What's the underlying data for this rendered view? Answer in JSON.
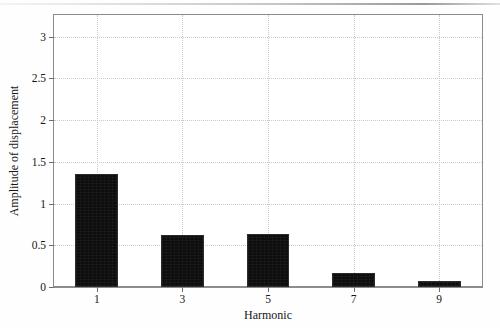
{
  "chart_data": {
    "type": "bar",
    "title": "",
    "subtitle": "",
    "xlabel": "Harmonic",
    "ylabel": "Amplitude of displacement",
    "categories": [
      "1",
      "3",
      "5",
      "7",
      "9"
    ],
    "values": [
      1.36,
      0.62,
      0.64,
      0.17,
      0.07
    ],
    "series": [
      {
        "name": "Amplitude of displacement",
        "values": [
          1.36,
          0.62,
          0.64,
          0.17,
          0.07
        ]
      }
    ],
    "ylim": [
      0,
      3.26
    ],
    "xlim": [
      0,
      10
    ],
    "yticks": [
      0,
      0.5,
      1,
      1.5,
      2,
      2.5,
      3
    ],
    "ytick_labels": [
      "0",
      "0.5",
      "1",
      "1.5",
      "2",
      "2.5",
      "3"
    ],
    "xticks": [
      1,
      3,
      5,
      7,
      9
    ],
    "xtick_labels": [
      "1",
      "3",
      "5",
      "7",
      "9"
    ],
    "grid": true,
    "grid_style": "dotted",
    "legend": false,
    "legend_position": "none",
    "bar_color": "#0d0d0d",
    "bar_edge_color": "#2b2b2b",
    "grid_color": "#c9c9c9",
    "axis_color": "#8c8c8c",
    "background_color": "#ffffff",
    "bar_width": 1.0
  }
}
